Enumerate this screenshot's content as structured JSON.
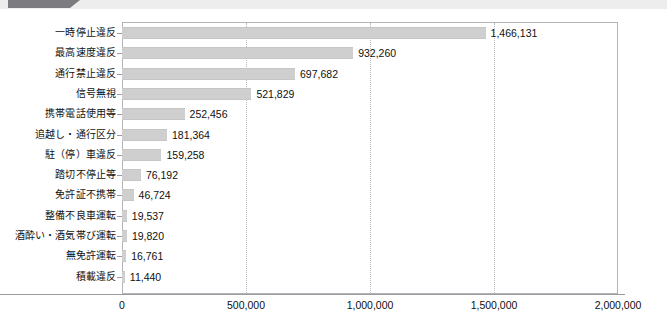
{
  "header": {
    "strip_color": "#ededee",
    "tab_color": "#7b7b80"
  },
  "chart_data": {
    "type": "bar",
    "orientation": "horizontal",
    "title": "",
    "subtitle": "",
    "xlabel": "",
    "ylabel": "",
    "xlim": [
      0,
      2000000
    ],
    "grid": true,
    "legend": false,
    "legend_position": "none",
    "bar_color": "#cfcfcf",
    "categories": [
      "一時停止違反",
      "最高速度違反",
      "通行禁止違反",
      "信号無視",
      "携帯電話使用等",
      "追越し・通行区分",
      "駐（停）車違反",
      "踏切不停止等",
      "免許証不携帯",
      "整備不良車運転",
      "酒酔い・酒気帯び運転",
      "無免許運転",
      "積載違反"
    ],
    "values": [
      1466131,
      932260,
      697682,
      521829,
      252456,
      181364,
      159258,
      76192,
      46724,
      19537,
      19820,
      16761,
      11440
    ],
    "value_labels": [
      "1,466,131",
      "932,260",
      "697,682",
      "521,829",
      "252,456",
      "181,364",
      "159,258",
      "76,192",
      "46,724",
      "19,537",
      "19,820",
      "16,761",
      "11,440"
    ],
    "xticks": [
      0,
      500000,
      1000000,
      1500000,
      2000000
    ],
    "xtick_labels": [
      "0",
      "500,000",
      "1,000,000",
      "1,500,000",
      "2,000,000"
    ]
  }
}
